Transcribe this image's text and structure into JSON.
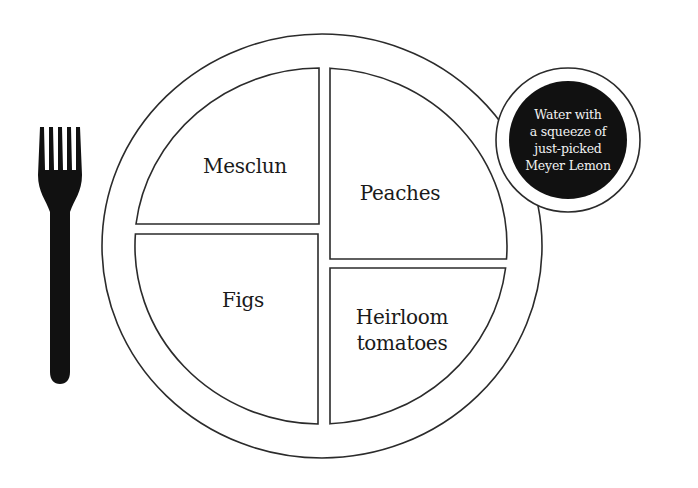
{
  "plate": {
    "sections": [
      {
        "id": "top-left",
        "label_lines": [
          "Mesclun"
        ]
      },
      {
        "id": "top-right",
        "label_lines": [
          "Peaches"
        ]
      },
      {
        "id": "bottom-left",
        "label_lines": [
          "Figs"
        ]
      },
      {
        "id": "bottom-right",
        "label_lines": [
          "Heirloom",
          "tomatoes"
        ]
      }
    ]
  },
  "glass": {
    "label_lines": [
      "Water with",
      "a squeeze of",
      "just-picked",
      "Meyer Lemon"
    ]
  },
  "utensil": {
    "icon": "fork-icon"
  },
  "colors": {
    "outline": "#2b2b2b",
    "fill_dark": "#111111",
    "background": "#ffffff",
    "glass_text": "#f2f2f2"
  }
}
